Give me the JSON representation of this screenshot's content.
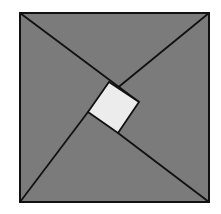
{
  "diagram": {
    "type": "geometric-figure",
    "colors": {
      "background": "#ffffff",
      "triangle_fill": "#7b7b7b",
      "inner_square_fill": "#ececec",
      "stroke": "#111111"
    },
    "outer_square": {
      "x": 20,
      "y": 13,
      "size": 189
    },
    "inner_square": {
      "points": [
        [
          109,
          82
        ],
        [
          139,
          102
        ],
        [
          118,
          133
        ],
        [
          88,
          112
        ]
      ]
    },
    "lines": [
      {
        "from": [
          20,
          13
        ],
        "to": [
          139,
          102
        ]
      },
      {
        "from": [
          209,
          13
        ],
        "to": [
          88,
          112
        ]
      },
      {
        "from": [
          209,
          202
        ],
        "to": [
          109,
          82
        ]
      },
      {
        "from": [
          20,
          202
        ],
        "to": [
          118,
          133
        ]
      }
    ]
  }
}
